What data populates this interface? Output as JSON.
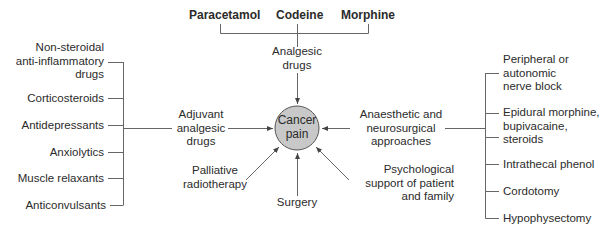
{
  "diagram": {
    "center": {
      "label": "Cancer\npain",
      "fill": "#c8c8c8",
      "stroke": "#555555"
    },
    "top": {
      "drugs": [
        "Paracetamol",
        "Codeine",
        "Morphine"
      ],
      "group_label": "Analgesic\ndrugs"
    },
    "left": {
      "group_label": "Adjuvant\nanalgesic\ndrugs",
      "items": [
        "Non-steroidal\nanti-inflammatory\ndrugs",
        "Corticosteroids",
        "Antidepressants",
        "Anxiolytics",
        "Muscle relaxants",
        "Anticonvulsants"
      ]
    },
    "right": {
      "group_label": "Anaesthetic and\nneurosurgical\napproaches",
      "items": [
        "Peripheral or\nautonomic\nnerve block",
        "Epidural morphine,\nbupivacaine,\nsteroids",
        "Intrathecal phenol",
        "Cordotomy",
        "Hypophysectomy"
      ]
    },
    "bottom": {
      "left": "Palliative\nradiotherapy",
      "center": "Surgery",
      "right": "Psychological\nsupport of patient\nand family"
    },
    "line_color": "#555555"
  }
}
